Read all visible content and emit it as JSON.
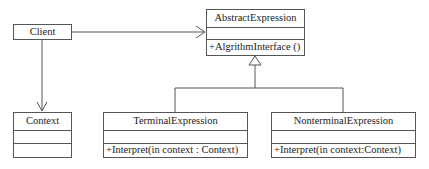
{
  "diagram": {
    "type": "UML class diagram",
    "pattern": "Interpreter",
    "classes": {
      "client": {
        "name": "Client"
      },
      "abstract_expression": {
        "name": "AbstractExpression",
        "attributes": "",
        "operations": "+AlgrithmInterface ()"
      },
      "context": {
        "name": "Context",
        "attributes": "",
        "operations": ""
      },
      "terminal_expression": {
        "name": "TerminalExpression",
        "attributes": "",
        "operations": "+Interpret(in context : Context)"
      },
      "nonterminal_expression": {
        "name": "NonterminalExpression",
        "attributes": "",
        "operations": "+Interpret(in context:Context)"
      }
    },
    "relationships": [
      {
        "from": "Client",
        "to": "AbstractExpression",
        "kind": "association",
        "arrow": "open"
      },
      {
        "from": "Client",
        "to": "Context",
        "kind": "association",
        "arrow": "open"
      },
      {
        "from": "TerminalExpression",
        "to": "AbstractExpression",
        "kind": "generalization",
        "arrow": "hollow-triangle"
      },
      {
        "from": "NonterminalExpression",
        "to": "AbstractExpression",
        "kind": "generalization",
        "arrow": "hollow-triangle"
      }
    ],
    "colors": {
      "line": "#555555",
      "text": "#222222",
      "background": "#ffffff"
    }
  }
}
